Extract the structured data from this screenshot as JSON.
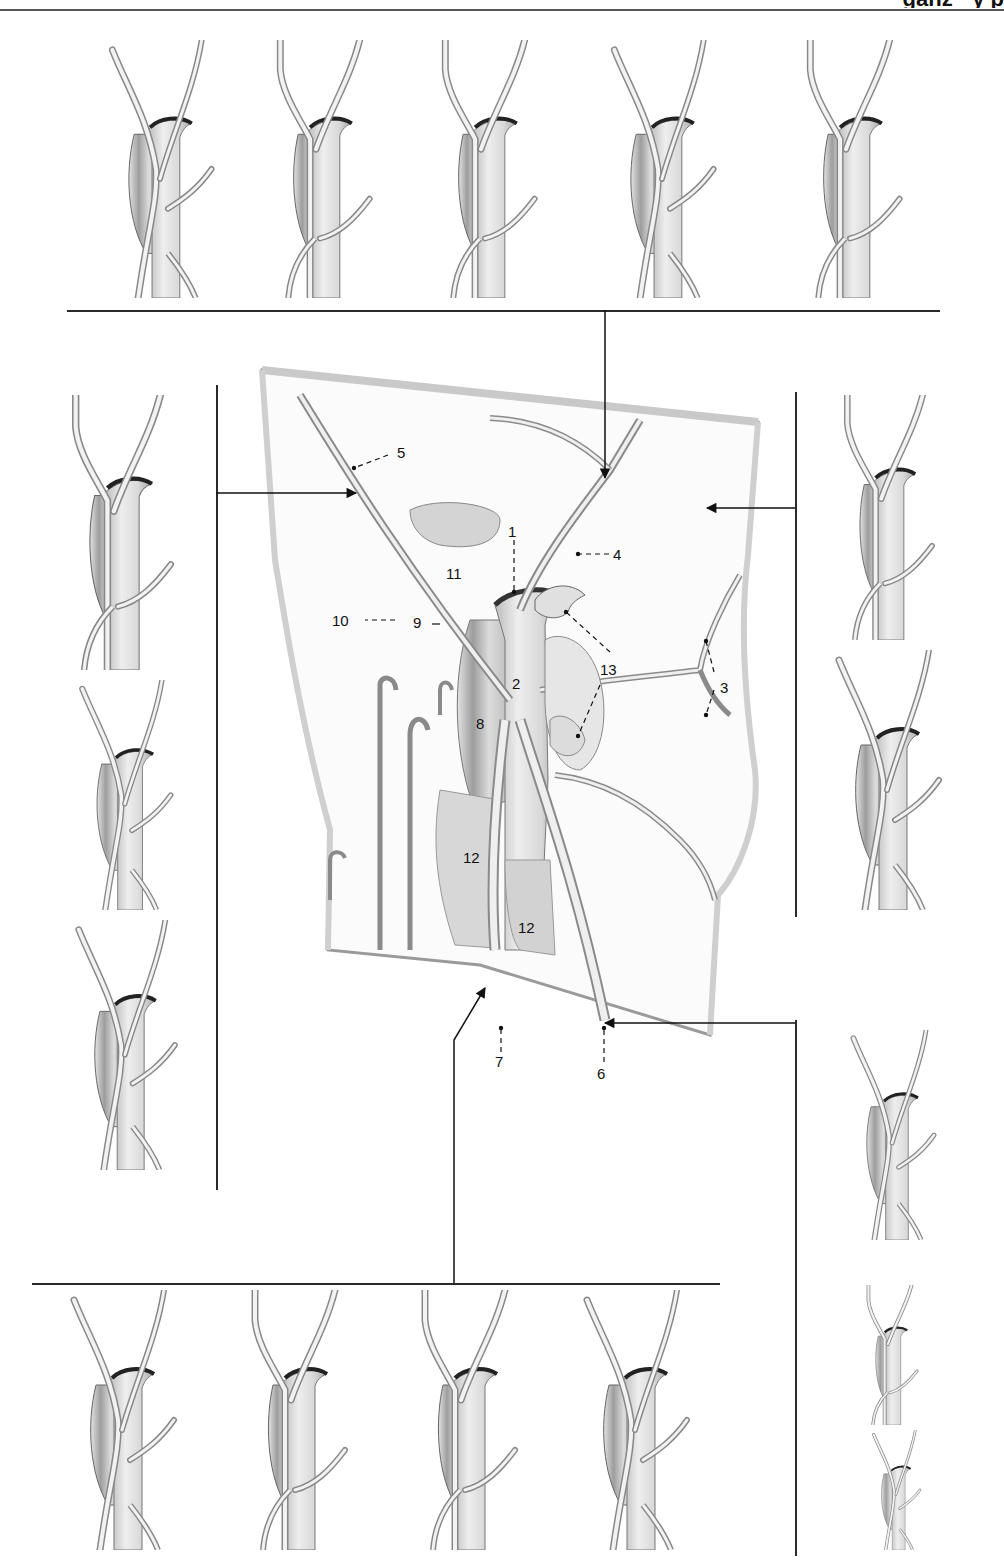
{
  "page": {
    "header_fragment": "ganz · y p",
    "background": "#ffffff",
    "ink_color": "#2a2a2a",
    "shade_color": "#9a9a9a"
  },
  "figure": {
    "type": "anatomical-variation-plate",
    "central_diagram": {
      "labels": [
        {
          "id": "1",
          "text": "1"
        },
        {
          "id": "2",
          "text": "2"
        },
        {
          "id": "3",
          "text": "3"
        },
        {
          "id": "4",
          "text": "4"
        },
        {
          "id": "5",
          "text": "5"
        },
        {
          "id": "6",
          "text": "6"
        },
        {
          "id": "7",
          "text": "7"
        },
        {
          "id": "8",
          "text": "8"
        },
        {
          "id": "9",
          "text": "9"
        },
        {
          "id": "10",
          "text": "10"
        },
        {
          "id": "11",
          "text": "11"
        },
        {
          "id": "12a",
          "text": "12"
        },
        {
          "id": "12b",
          "text": "12"
        },
        {
          "id": "13",
          "text": "13"
        }
      ]
    },
    "variant_groups": [
      {
        "position": "top",
        "count": 5,
        "points_to_label": "4"
      },
      {
        "position": "left",
        "count": 3,
        "points_to_label": "5"
      },
      {
        "position": "right-upper",
        "count": 2,
        "points_to_label": "3"
      },
      {
        "position": "right-lower",
        "count": 3,
        "points_to_label": "6"
      },
      {
        "position": "bottom",
        "count": 4,
        "points_to_label": "7"
      }
    ]
  }
}
